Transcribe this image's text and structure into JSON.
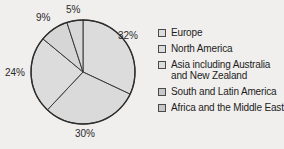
{
  "chart_data": {
    "type": "pie",
    "title": "",
    "subtitle": "",
    "xlabel": "",
    "ylabel": "",
    "legend_position": "right",
    "grid": false,
    "start_angle_deg": 0,
    "direction": "clockwise",
    "categories": [
      "Europe",
      "North America",
      "Asia including Australia and New Zealand",
      "South and Latin America",
      "Africa and the Middle East"
    ],
    "values": [
      32,
      30,
      24,
      9,
      5
    ],
    "value_labels": [
      "32%",
      "30%",
      "24%",
      "9%",
      "5%"
    ],
    "slices": [
      {
        "label": "Europe",
        "value": 32,
        "display": "32%",
        "color": "#dedede",
        "edge": "#3a3a3a"
      },
      {
        "label": "North America",
        "value": 30,
        "display": "30%",
        "color": "#dcdcdc",
        "edge": "#3a3a3a"
      },
      {
        "label": "Asia including Australia and New Zealand",
        "value": 24,
        "display": "24%",
        "color": "#dedede",
        "edge": "#3a3a3a"
      },
      {
        "label": "South and Latin America",
        "value": 9,
        "display": "9%",
        "color": "#d8d8d8",
        "edge": "#3a3a3a"
      },
      {
        "label": "Africa and the Middle East",
        "value": 5,
        "display": "5%",
        "color": "#dadada",
        "edge": "#3a3a3a"
      }
    ]
  },
  "labels": {
    "pct_32": "32%",
    "pct_30": "30%",
    "pct_24": "24%",
    "pct_9": "9%",
    "pct_5": "5%"
  },
  "legend": {
    "items": [
      {
        "label": "Europe",
        "line2": ""
      },
      {
        "label": "North America",
        "line2": ""
      },
      {
        "label": "Asia including Australia",
        "line2": "and New Zealand"
      },
      {
        "label": "South and Latin America",
        "line2": ""
      },
      {
        "label": "Africa and the Middle East",
        "line2": ""
      }
    ]
  },
  "colors": {
    "background": "#f2f1ef",
    "slice_fill": "#dedede",
    "slice_edge": "#3a3a3a",
    "text": "#1d1d1d"
  }
}
